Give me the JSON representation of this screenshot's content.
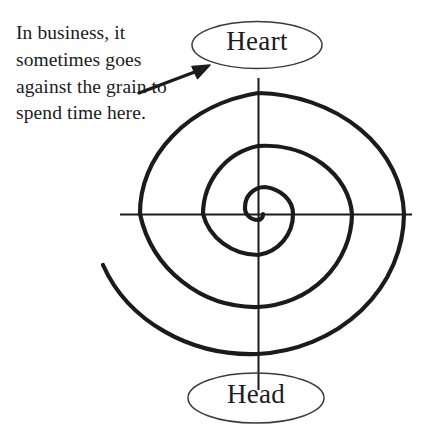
{
  "figure": {
    "type": "spiral-diagram",
    "background_color": "#ffffff",
    "ink_color": "#1b1b1b",
    "annotation": {
      "text": "In business, it sometimes goes against the grain to spend time here.",
      "lines": [
        "In business, it",
        "sometimes",
        "goes against",
        "the grain to",
        "spend time",
        "here."
      ],
      "pointer_icon": "arrow-icon",
      "pointer_target": "Heart"
    },
    "nodes": [
      {
        "id": "heart",
        "label": "Heart",
        "shape": "ellipse",
        "position": "top",
        "center_x": 257,
        "center_y": 45,
        "radius_x": 65,
        "radius_y": 24
      },
      {
        "id": "head",
        "label": "Head",
        "shape": "ellipse",
        "position": "bottom",
        "center_x": 256,
        "center_y": 398,
        "radius_x": 68,
        "radius_y": 25
      }
    ],
    "spiral": {
      "center_x": 258,
      "center_y": 214,
      "turns": 3,
      "axis_horizontal": {
        "x1": 120,
        "x2": 412,
        "y": 214
      },
      "axis_vertical": {
        "y1": 78,
        "y2": 390,
        "x": 258
      },
      "horizontal_crossings_left": [
        137,
        192,
        232
      ],
      "horizontal_crossings_right": [
        272,
        293,
        352,
        404
      ],
      "vertical_crossings_top": [
        92,
        143,
        186
      ],
      "vertical_crossings_bottom": [
        233,
        303,
        352
      ],
      "outer_end_x": 103,
      "outer_end_y": 265
    }
  }
}
